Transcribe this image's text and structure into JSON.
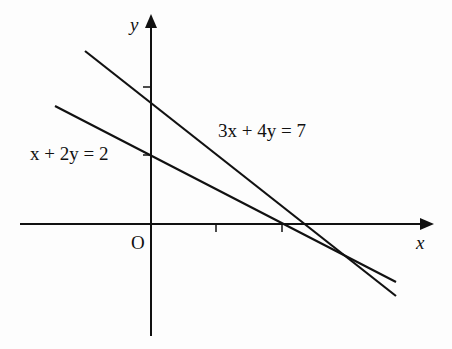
{
  "diagram": {
    "axes": {
      "x_label": "x",
      "y_label": "y",
      "origin_label": "O",
      "x_ticks": [
        1,
        2
      ],
      "y_ticks": [
        1,
        2
      ]
    },
    "lines": [
      {
        "equation": "3x + 4y = 7",
        "label": "3x + 4y = 7",
        "y_intercept": 1.75,
        "x_intercept": 2.333
      },
      {
        "equation": "x + 2y = 2",
        "label": "x + 2y = 2",
        "y_intercept": 1,
        "x_intercept": 2
      }
    ],
    "intersection": {
      "x": 3,
      "y": -0.5
    }
  }
}
